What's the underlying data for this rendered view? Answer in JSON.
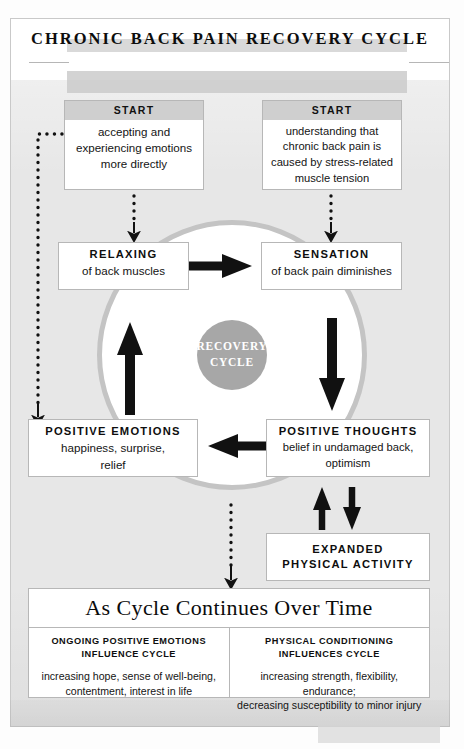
{
  "document": {
    "title": "CHRONIC BACK PAIN RECOVERY CYCLE"
  },
  "cycle": {
    "center_line1": "RECOVERY",
    "center_line2": "CYCLE"
  },
  "nodes": {
    "start_left": {
      "header": "START",
      "body": "accepting and\nexperiencing emotions\nmore directly"
    },
    "start_right": {
      "header": "START",
      "body": "understanding that\nchronic back pain is\ncaused by stress-related\nmuscle tension"
    },
    "relaxing": {
      "header": "RELAXING",
      "body": "of back muscles"
    },
    "sensation": {
      "header": "SENSATION",
      "body": "of back pain diminishes"
    },
    "positive_emotions": {
      "header": "POSITIVE EMOTIONS",
      "body": "happiness, surprise,\nrelief"
    },
    "positive_thoughts": {
      "header": "POSITIVE THOUGHTS",
      "body": "belief in undamaged back,\noptimism"
    },
    "expanded_activity": {
      "line1": "EXPANDED",
      "line2": "PHYSICAL ACTIVITY"
    }
  },
  "continuation": {
    "title": "As Cycle Continues Over Time",
    "columns": [
      {
        "header_line1": "ONGOING POSITIVE EMOTIONS",
        "header_line2": "INFLUENCE CYCLE",
        "body": "increasing hope, sense of well-being,\ncontentment, interest in life"
      },
      {
        "header_line1": "PHYSICAL CONDITIONING",
        "header_line2": "INFLUENCES CYCLE",
        "body": "increasing strength, flexibility,\nendurance;\ndecreasing susceptibility to minor injury"
      }
    ]
  },
  "colors": {
    "frame_fill": "#e7e7e7",
    "frame_border": "#c9c9c9",
    "box_border": "#b7b7b7",
    "header_band": "#cfcfcf",
    "ring_stroke": "#c4c4c4",
    "core_fill": "#a7a7a7",
    "arrow_black": "#111111",
    "text": "#141414"
  }
}
